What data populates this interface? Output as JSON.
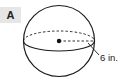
{
  "figure": {
    "label": "A",
    "shape": "sphere",
    "measurement": {
      "label": "6 in.",
      "dimension": "radius"
    },
    "colors": {
      "stroke": "#1a1a1a",
      "badge_bg": "#e6e6e6",
      "background": "#ffffff"
    }
  }
}
